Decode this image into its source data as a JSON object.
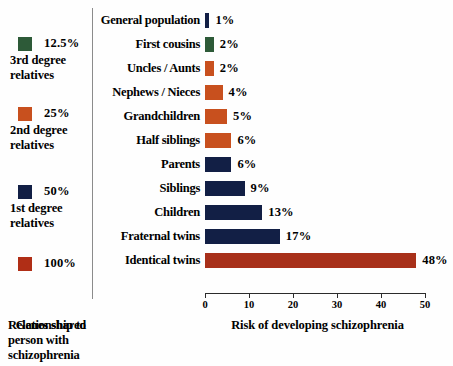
{
  "legend": {
    "title": "Genes shared",
    "items": [
      {
        "swatch_color": "#2d5a38",
        "percent": "12.5%",
        "description": "3rd degree\nrelatives",
        "line1": "3rd degree",
        "line2": "relatives"
      },
      {
        "swatch_color": "#c8501e",
        "percent": "25%",
        "description": "2nd degree\nrelatives",
        "line1": "2nd degree",
        "line2": "relatives"
      },
      {
        "swatch_color": "#121f45",
        "percent": "50%",
        "description": "1st degree\nrelatives",
        "line1": "1st degree",
        "line2": "relatives"
      },
      {
        "swatch_color": "#b02e16",
        "percent": "100%",
        "description": "",
        "line1": "",
        "line2": ""
      }
    ]
  },
  "captions": {
    "relationship_line1": "Relationship to",
    "relationship_line2": "person with",
    "relationship_line3": "schizophrenia"
  },
  "chart_data": {
    "type": "bar",
    "orientation": "horizontal",
    "title": "",
    "xlabel": "Risk of developing schizophrenia",
    "ylabel": "",
    "xlim": [
      0,
      50
    ],
    "xticks": [
      0,
      10,
      20,
      30,
      40,
      50
    ],
    "xtick_labels": [
      "0",
      "10",
      "20",
      "30",
      "40",
      "50"
    ],
    "grid": false,
    "legend_position": "left",
    "categories": [
      "General population",
      "First cousins",
      "Uncles / Aunts",
      "Nephews / Nieces",
      "Grandchildren",
      "Half siblings",
      "Parents",
      "Siblings",
      "Children",
      "Fraternal twins",
      "Identical twins"
    ],
    "values": [
      1,
      2,
      2,
      4,
      5,
      6,
      6,
      9,
      13,
      17,
      48
    ],
    "value_labels": [
      "1%",
      "2%",
      "2%",
      "4%",
      "5%",
      "6%",
      "6%",
      "9%",
      "13%",
      "17%",
      "48%"
    ],
    "bar_colors": [
      "#121f45",
      "#2d5a38",
      "#c8501e",
      "#c8501e",
      "#c8501e",
      "#c8501e",
      "#121f45",
      "#121f45",
      "#121f45",
      "#121f45",
      "#a8301a"
    ]
  }
}
